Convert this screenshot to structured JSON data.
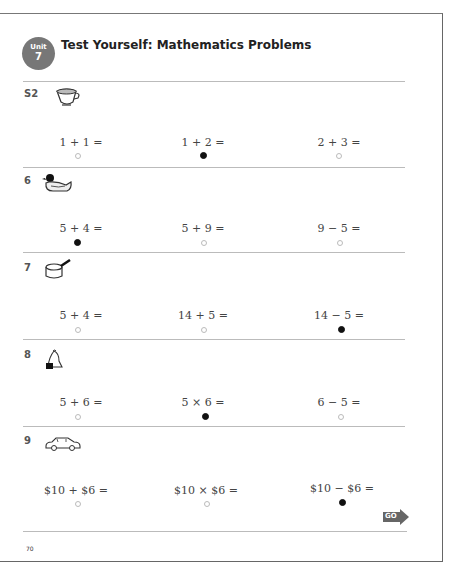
{
  "header": {
    "unit_label": "Unit",
    "unit_number": "7",
    "title": "Test Yourself: Mathematics Problems"
  },
  "questions": [
    {
      "number": "S2",
      "icon": "teacup-icon",
      "options": [
        {
          "text": "1 + 1 =",
          "selected": false
        },
        {
          "text": "1 + 2 =",
          "selected": true
        },
        {
          "text": "2 + 3 =",
          "selected": false
        }
      ]
    },
    {
      "number": "6",
      "icon": "duck-icon",
      "options": [
        {
          "text": "5 + 4 =",
          "selected": true
        },
        {
          "text": "5 + 9 =",
          "selected": false
        },
        {
          "text": "9 − 5 =",
          "selected": false
        }
      ]
    },
    {
      "number": "7",
      "icon": "pot-icon",
      "options": [
        {
          "text": "5 + 4 =",
          "selected": false
        },
        {
          "text": "14 + 5 =",
          "selected": false
        },
        {
          "text": "14 − 5 =",
          "selected": true
        }
      ]
    },
    {
      "number": "8",
      "icon": "bell-icon",
      "options": [
        {
          "text": "5 + 6 =",
          "selected": false
        },
        {
          "text": "5 × 6 =",
          "selected": true
        },
        {
          "text": "6 − 5 =",
          "selected": false
        }
      ]
    },
    {
      "number": "9",
      "icon": "car-icon",
      "options": [
        {
          "text": "$10 + $6 =",
          "selected": false
        },
        {
          "text": "$10 × $6 =",
          "selected": false
        },
        {
          "text": "$10 − $6 =",
          "selected": true
        }
      ]
    }
  ],
  "footer": {
    "go_label": "GO",
    "page_number": "70"
  }
}
